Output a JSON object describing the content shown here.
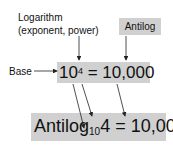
{
  "labels": {
    "logarithm_line1": "Logarithm",
    "logarithm_line2": "(exponent, power)",
    "antilog": "Antilog",
    "base": "Base"
  },
  "equation_top": {
    "base": "10",
    "exponent": "4",
    "equals": "=",
    "result": "10,000"
  },
  "equation_bottom": {
    "func": "Antilog",
    "subscript": "10",
    "arg": "4",
    "equals": "=",
    "result": "10,000"
  },
  "colors": {
    "box_fill": "#d0d0d0",
    "text": "#111111",
    "arrow": "#222222"
  }
}
